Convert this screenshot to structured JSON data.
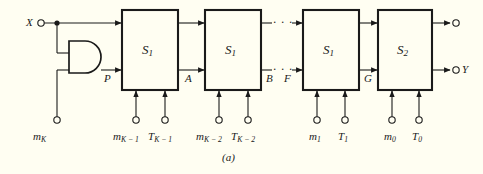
{
  "figure": {
    "caption": "(a)",
    "background_color": "#fffef2",
    "ink_color": "#1a1a1a",
    "type": "logic-circuit-block-diagram"
  },
  "blocks": [
    {
      "id": "b1",
      "label_base": "S",
      "label_sub": "1",
      "x": 122,
      "y": 10,
      "w": 56,
      "h": 80
    },
    {
      "id": "b2",
      "label_base": "S",
      "label_sub": "1",
      "x": 205,
      "y": 10,
      "w": 56,
      "h": 80
    },
    {
      "id": "b3",
      "label_base": "S",
      "label_sub": "1",
      "x": 303,
      "y": 10,
      "w": 56,
      "h": 80
    },
    {
      "id": "b4",
      "label_base": "S",
      "label_sub": "2",
      "x": 378,
      "y": 10,
      "w": 54,
      "h": 80
    }
  ],
  "inputs": {
    "x_terminal": {
      "label": "X"
    },
    "and_gate": {
      "name": "and-gate",
      "output_label": "P"
    },
    "mk_terminal": {
      "label_base": "m",
      "label_sub": "K"
    }
  },
  "signals": [
    {
      "name": "signal-a",
      "label": "A"
    },
    {
      "name": "signal-b",
      "label": "B"
    },
    {
      "name": "signal-f",
      "label": "F"
    },
    {
      "name": "signal-g",
      "label": "G"
    },
    {
      "name": "signal-p",
      "label": "P"
    }
  ],
  "outputs": [
    {
      "name": "output-top",
      "label": ""
    },
    {
      "name": "output-y",
      "label": "Y"
    }
  ],
  "bottom_terminals": [
    {
      "base": "m",
      "sub": "K − 1",
      "x": 131
    },
    {
      "base": "T",
      "sub": "K − 1",
      "x": 163
    },
    {
      "base": "m",
      "sub": "K − 2",
      "x": 213
    },
    {
      "base": "T",
      "sub": "K − 2",
      "x": 245
    },
    {
      "base": "m",
      "sub": "1",
      "x": 313
    },
    {
      "base": "T",
      "sub": "1",
      "x": 340
    },
    {
      "base": "m",
      "sub": "0",
      "x": 388
    },
    {
      "base": "T",
      "sub": "0",
      "x": 415
    }
  ],
  "ellipsis": {
    "glyph": "· · ·",
    "rows": 2
  }
}
